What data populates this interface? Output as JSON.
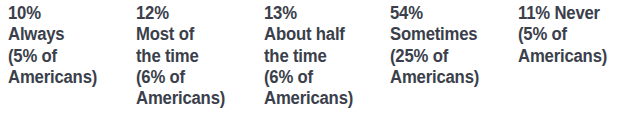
{
  "figure": {
    "type": "statistic-callout-row",
    "background_color": "#ffffff",
    "text_color": "#3b3f4b",
    "columns": [
      {
        "id": "always",
        "percent": "10%",
        "label": "Always",
        "sub_percent": "(5% of",
        "sub_label": "Americans)",
        "lines": [
          "10%",
          "Always",
          "(5% of",
          "Americans)"
        ]
      },
      {
        "id": "most-of-the-time",
        "percent": "12%",
        "label": "Most of the time",
        "sub_percent": "(6% of",
        "sub_label": "Americans)",
        "lines": [
          "12%",
          "Most of",
          "the time",
          "(6% of",
          "Americans)"
        ]
      },
      {
        "id": "about-half-the-time",
        "percent": "13%",
        "label": "About half the time",
        "sub_percent": "(6% of",
        "sub_label": "Americans)",
        "lines": [
          "13%",
          "About half",
          "the time",
          "(6% of",
          "Americans)"
        ]
      },
      {
        "id": "sometimes",
        "percent": "54%",
        "label": "Sometimes",
        "sub_percent": "(25% of",
        "sub_label": "Americans)",
        "lines": [
          "54%",
          "Sometimes",
          "(25% of",
          "Americans)"
        ]
      },
      {
        "id": "never",
        "percent": "11%",
        "label": "Never",
        "sub_percent": "(5% of",
        "sub_label": "Americans)",
        "lines": [
          "11% Never",
          "(5% of",
          "Americans)"
        ]
      }
    ]
  },
  "chart_data": {
    "type": "table",
    "title": "",
    "xlabel": "",
    "ylabel": "",
    "categories": [
      "Always",
      "Most of the time",
      "About half the time",
      "Sometimes",
      "Never"
    ],
    "series": [
      {
        "name": "Share of respondents",
        "values": [
          10,
          12,
          13,
          54,
          11
        ]
      },
      {
        "name": "Share of Americans",
        "values": [
          5,
          6,
          6,
          25,
          5
        ]
      }
    ],
    "value_labels": [
      "10%",
      "12%",
      "13%",
      "54%",
      "11%"
    ],
    "secondary_labels": [
      "(5% of Americans)",
      "(6% of Americans)",
      "(6% of Americans)",
      "(25% of Americans)",
      "(5% of Americans)"
    ]
  }
}
